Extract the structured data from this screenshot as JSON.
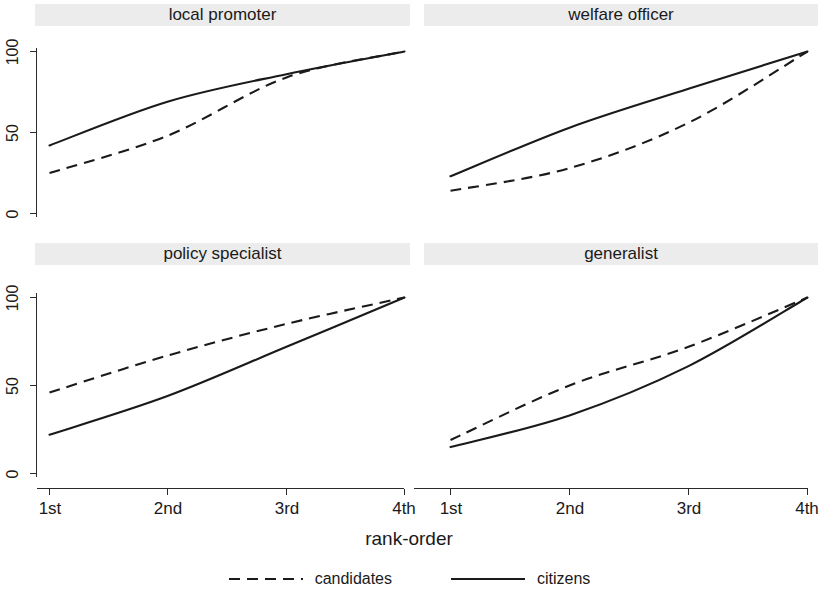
{
  "chart_data": {
    "type": "line",
    "title": "",
    "xlabel": "rank-order",
    "ylabel": "",
    "categories": [
      "1st",
      "2nd",
      "3rd",
      "4th"
    ],
    "ylim": [
      0,
      100
    ],
    "yticks": [
      0,
      50,
      100
    ],
    "ytick_labels": [
      "0",
      "50",
      "100"
    ],
    "grid": false,
    "legend_position": "bottom",
    "legend": [
      {
        "name": "candidates",
        "style": "dashed"
      },
      {
        "name": "citizens",
        "style": "solid"
      }
    ],
    "panels": [
      {
        "title": "local promoter",
        "series": [
          {
            "name": "candidates",
            "style": "dashed",
            "values": [
              25,
              48,
              84,
              100
            ]
          },
          {
            "name": "citizens",
            "style": "solid",
            "values": [
              42,
              69,
              86,
              100
            ]
          }
        ]
      },
      {
        "title": "welfare officer",
        "series": [
          {
            "name": "candidates",
            "style": "dashed",
            "values": [
              14,
              28,
              56,
              100
            ]
          },
          {
            "name": "citizens",
            "style": "solid",
            "values": [
              23,
              53,
              77,
              100
            ]
          }
        ]
      },
      {
        "title": "policy specialist",
        "series": [
          {
            "name": "candidates",
            "style": "dashed",
            "values": [
              46,
              67,
              85,
              100
            ]
          },
          {
            "name": "citizens",
            "style": "solid",
            "values": [
              22,
              44,
              72,
              100
            ]
          }
        ]
      },
      {
        "title": "generalist",
        "series": [
          {
            "name": "candidates",
            "style": "dashed",
            "values": [
              19,
              50,
              72,
              100
            ]
          },
          {
            "name": "citizens",
            "style": "solid",
            "values": [
              15,
              33,
              61,
              100
            ]
          }
        ]
      }
    ]
  },
  "colors": {
    "line": "#1a1a1a",
    "axis": "#2b2b2b",
    "panel_title_background": "#ececec",
    "background": "#ffffff"
  }
}
